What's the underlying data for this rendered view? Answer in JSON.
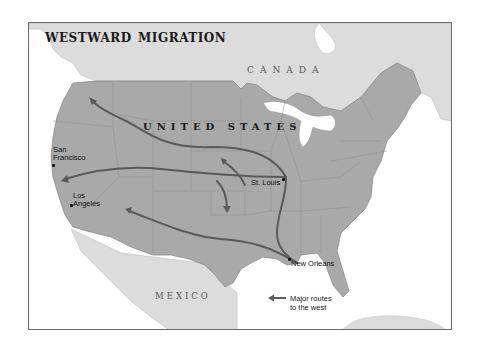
{
  "map": {
    "title": "westward migration",
    "countries": {
      "canada": "CANADA",
      "united_states": "UNITED STATES",
      "mexico": "MEXICO"
    },
    "cities": [
      {
        "name_line1": "San",
        "name_line2": "Francisco"
      },
      {
        "name_line1": "Los",
        "name_line2": "Angeles"
      },
      {
        "name_line1": "St. Louis",
        "name_line2": ""
      },
      {
        "name_line1": "New Orleans",
        "name_line2": ""
      }
    ],
    "legend": {
      "icon": "arrow-left-icon",
      "line1": "Major routes",
      "line2": "to the west"
    },
    "colors": {
      "us_land": "#a9a9a9",
      "foreign_land": "#dcdcdc",
      "water": "#ffffff",
      "route": "#5a5a5a",
      "border": "#8c8c8c"
    }
  }
}
